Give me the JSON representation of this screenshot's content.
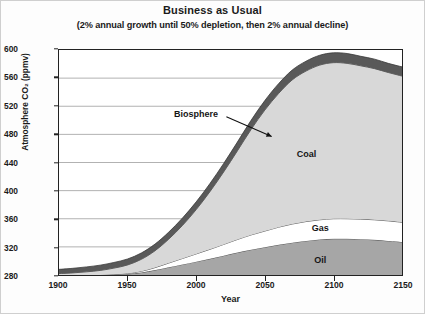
{
  "chart_data": {
    "type": "area",
    "title": "Business as Usual",
    "subtitle": "(2% annual growth until 50% depletion, then 2% annual decline)",
    "xlabel": "Year",
    "ylabel": "Atmosphere CO₂ (ppmv)",
    "xlim": [
      1900,
      2150
    ],
    "ylim": [
      280,
      600
    ],
    "xticks": [
      1900,
      1950,
      2000,
      2050,
      2100,
      2150
    ],
    "yticks": [
      280,
      320,
      360,
      400,
      440,
      480,
      520,
      560,
      600
    ],
    "grid": true,
    "legend_position": "inline-annotations",
    "stacked": true,
    "baseline": 280,
    "x": [
      1900,
      1910,
      1920,
      1930,
      1940,
      1950,
      1960,
      1970,
      1980,
      1990,
      2000,
      2010,
      2020,
      2030,
      2040,
      2050,
      2060,
      2070,
      2080,
      2090,
      2100,
      2110,
      2120,
      2130,
      2140,
      2150
    ],
    "series": [
      {
        "name": "Oil",
        "color": "#a6a6a6",
        "label_position": {
          "x": 2090,
          "y": 302
        },
        "values": [
          0,
          0,
          0,
          0,
          0.5,
          1.5,
          3.5,
          7,
          11,
          15,
          19,
          23,
          27.5,
          32,
          36,
          39.5,
          43,
          46,
          48.5,
          50.5,
          51.5,
          51.5,
          51,
          50,
          48.5,
          47
        ]
      },
      {
        "name": "Gas",
        "color": "#ffffff",
        "label_position": {
          "x": 2090,
          "y": 348
        },
        "values": [
          0,
          0,
          0,
          0,
          0.3,
          0.8,
          1.8,
          3.5,
          6,
          8.5,
          11,
          13.5,
          16,
          18.5,
          21,
          23,
          25,
          26.5,
          27.5,
          28,
          28.5,
          28.5,
          28.5,
          28.5,
          28.5,
          28
        ]
      },
      {
        "name": "Coal",
        "color": "#d8d8d8",
        "label_position": {
          "x": 2080,
          "y": 452
        },
        "values": [
          2,
          3,
          4.5,
          6.5,
          9,
          12,
          17,
          24,
          34,
          47,
          63,
          82,
          103,
          126,
          150,
          172,
          190,
          205,
          214,
          220,
          222,
          221,
          218,
          215,
          211,
          208
        ]
      },
      {
        "name": "Biosphere",
        "color": "#595959",
        "label_position": {
          "x": 2000,
          "y": 508
        },
        "arrow_from": {
          "x": 2022,
          "y": 505
        },
        "arrow_to": {
          "x": 2055,
          "y": 477
        },
        "values": [
          6,
          6.5,
          7,
          7.5,
          8,
          8.5,
          9,
          9.5,
          10,
          10.5,
          11,
          11.5,
          12,
          12.5,
          13,
          13.5,
          14,
          14,
          14,
          14,
          14,
          14,
          13.5,
          13.5,
          13,
          13
        ]
      }
    ],
    "annotations": [
      {
        "text": "Biosphere",
        "kind": "callout-with-arrow"
      },
      {
        "text": "Coal",
        "kind": "inline"
      },
      {
        "text": "Gas",
        "kind": "inline"
      },
      {
        "text": "Oil",
        "kind": "inline"
      }
    ]
  }
}
